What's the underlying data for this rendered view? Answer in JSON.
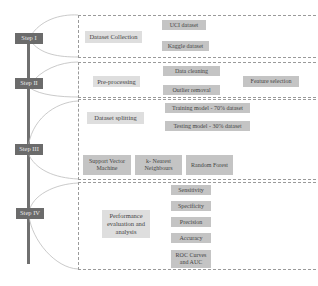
{
  "steps": [
    {
      "label": "Step I"
    },
    {
      "label": "Step II"
    },
    {
      "label": "Step III"
    },
    {
      "label": "Step IV"
    }
  ],
  "step1": {
    "main": "Dataset Collection",
    "items": [
      "UCI dataset",
      "Kaggle dataset"
    ]
  },
  "step2": {
    "main": "Pre-processing",
    "items": [
      "Data cleaning",
      "Outlier removal"
    ],
    "result": "Feature selection"
  },
  "step3": {
    "main": "Dataset splitting",
    "items": [
      "Training model - 70% dataset",
      "Testing model - 30% dataset"
    ],
    "models": [
      "Support Vector Machine",
      "k- Nearest Neighbours",
      "Random Forest"
    ]
  },
  "step4": {
    "main": "Performance evaluation and analysis",
    "metrics": [
      "Sensitivity",
      "Specificity",
      "Precision",
      "Accuracy",
      "ROC Curves and AUC"
    ]
  },
  "colors": {
    "step_fill": "#6b6b6b",
    "box_fill": "#c4c4c4",
    "label_fill": "#dedede",
    "spine": "#707070",
    "connector": "#b0b0b0"
  }
}
